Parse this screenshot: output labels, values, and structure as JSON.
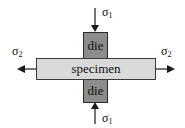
{
  "diagram": {
    "top_die": {
      "label": "die"
    },
    "bottom_die": {
      "label": "die"
    },
    "specimen": {
      "label": "specimen"
    },
    "stresses": {
      "top": {
        "symbol": "σ",
        "subscript": "1"
      },
      "bottom": {
        "symbol": "σ",
        "subscript": "1"
      },
      "left": {
        "symbol": "σ",
        "subscript": "2"
      },
      "right": {
        "symbol": "σ",
        "subscript": "2"
      }
    },
    "colors": {
      "die_fill": "#8c8c8c",
      "specimen_fill": "#d9d9d9",
      "stroke": "#1a1a1a"
    }
  }
}
